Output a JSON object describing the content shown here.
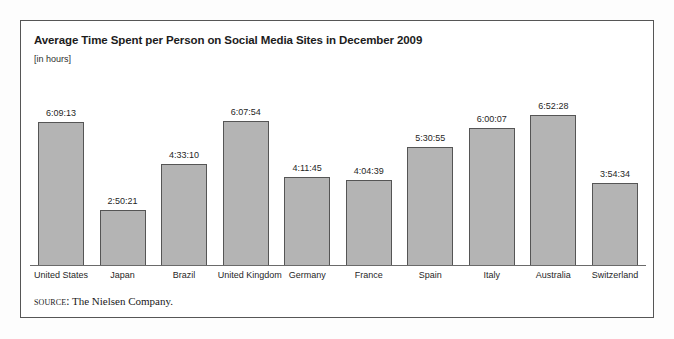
{
  "figure": {
    "title": "Average Time Spent per Person on Social Media Sites in December 2009",
    "subtitle": "[in hours]",
    "source_label": "source:",
    "source_text": " The Nielsen Company.",
    "frame_color": "#565656",
    "bar_fill_color": "#b4b4b4",
    "bar_stroke_color": "#555555",
    "axis_color": "#6a6a6a",
    "background_color": "#ffffff"
  },
  "chart_data": {
    "type": "bar",
    "title": "Average Time Spent per Person on Social Media Sites in December 2009",
    "subtitle": "[in hours]",
    "xlabel": "",
    "ylabel": "[in hours]",
    "grid": false,
    "legend": "none",
    "axis_visible": {
      "x": true,
      "y": false
    },
    "value_format": "h:mm:ss",
    "categories": [
      "United States",
      "Japan",
      "Brazil",
      "United Kingdom",
      "Germany",
      "France",
      "Spain",
      "Italy",
      "Australia",
      "Switzerland"
    ],
    "value_labels": [
      "6:09:13",
      "2:50:21",
      "4:33:10",
      "6:07:54",
      "4:11:45",
      "4:04:39",
      "5:30:55",
      "6:00:07",
      "6:52:28",
      "3:54:34"
    ],
    "values": [
      6.154,
      2.839,
      4.553,
      6.132,
      4.196,
      4.078,
      5.515,
      6.002,
      6.874,
      3.909
    ],
    "bar_pixel_heights": [
      143,
      55,
      101,
      144,
      88,
      85,
      118,
      137,
      150,
      82
    ],
    "ylim": [
      0,
      7.2
    ],
    "points": [
      {
        "category": "United States",
        "label": "6:09:13",
        "hours": 6.154,
        "px": 143
      },
      {
        "category": "Japan",
        "label": "2:50:21",
        "hours": 2.839,
        "px": 55
      },
      {
        "category": "Brazil",
        "label": "4:33:10",
        "hours": 4.553,
        "px": 101
      },
      {
        "category": "United Kingdom",
        "label": "6:07:54",
        "hours": 6.132,
        "px": 144
      },
      {
        "category": "Germany",
        "label": "4:11:45",
        "hours": 4.196,
        "px": 88
      },
      {
        "category": "France",
        "label": "4:04:39",
        "hours": 4.078,
        "px": 85
      },
      {
        "category": "Spain",
        "label": "5:30:55",
        "hours": 5.515,
        "px": 118
      },
      {
        "category": "Italy",
        "label": "6:00:07",
        "hours": 6.002,
        "px": 137
      },
      {
        "category": "Australia",
        "label": "6:52:28",
        "hours": 6.874,
        "px": 150
      },
      {
        "category": "Switzerland",
        "label": "3:54:34",
        "hours": 3.909,
        "px": 82
      }
    ]
  }
}
